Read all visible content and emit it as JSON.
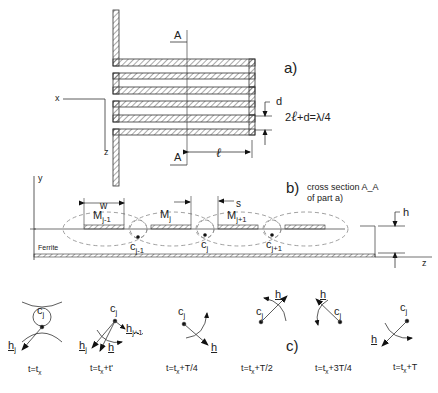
{
  "panel_a": {
    "label": "a)",
    "section_top": "A",
    "section_bottom": "A",
    "axis_x": "x",
    "axis_z": "z",
    "dim_d": "d",
    "dim_l": "ℓ",
    "equation_prefix": "2",
    "equation_l": "ℓ",
    "equation_rest": "+d=λ/4"
  },
  "panel_b": {
    "label": "b)",
    "caption_line1": "cross section A_A",
    "caption_line2": "of part a)",
    "axis_y": "y",
    "axis_z": "z",
    "dim_w": "w",
    "dim_s": "s",
    "dim_h": "h",
    "substrate": "Ferrite",
    "strips": [
      {
        "name": "M",
        "sub": "j-1"
      },
      {
        "name": "M",
        "sub": "j"
      },
      {
        "name": "M",
        "sub": "j+1"
      }
    ],
    "centers": [
      {
        "name": "c",
        "sub": "j-1"
      },
      {
        "name": "c",
        "sub": "j"
      },
      {
        "name": "c",
        "sub": "j+1"
      }
    ]
  },
  "panel_c": {
    "label": "c)",
    "frames": [
      {
        "time": "t=t",
        "time_sub": "x",
        "time_suffix": "",
        "center": "c",
        "center_sub": "j",
        "vec": "h",
        "vec_sub": "j"
      },
      {
        "time": "t=t",
        "time_sub": "x",
        "time_suffix": "+t'",
        "center": "c",
        "center_sub": "j",
        "vec": "h",
        "vec_sub": "",
        "extra1": "h",
        "extra1_sub": "j",
        "extra2": "h",
        "extra2_sub": "j+1"
      },
      {
        "time": "t=t",
        "time_sub": "x",
        "time_suffix": "+T/4",
        "center": "c",
        "center_sub": "j",
        "vec": "h",
        "vec_sub": ""
      },
      {
        "time": "t=t",
        "time_sub": "x",
        "time_suffix": "+T/2",
        "center": "c",
        "center_sub": "j",
        "vec": "h",
        "vec_sub": ""
      },
      {
        "time": "t=t",
        "time_sub": "x",
        "time_suffix": "+3T/4",
        "center": "c",
        "center_sub": "j",
        "vec": "h",
        "vec_sub": ""
      },
      {
        "time": "t=t",
        "time_sub": "x",
        "time_suffix": "+T",
        "center": "c",
        "center_sub": "j",
        "vec": "h",
        "vec_sub": ""
      }
    ]
  }
}
